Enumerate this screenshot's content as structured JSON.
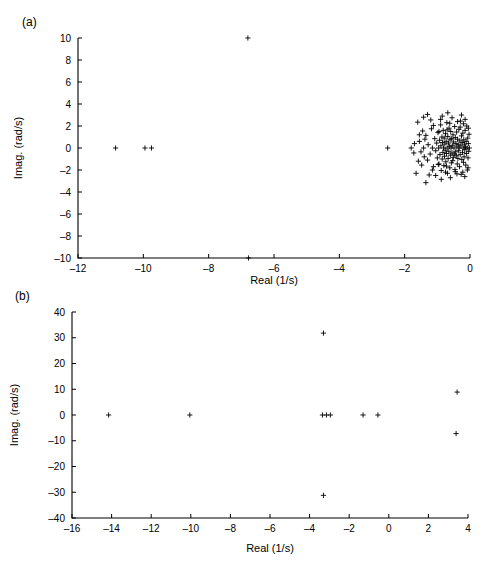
{
  "figure": {
    "panels": [
      {
        "tag": "panel-a",
        "label": "(a)"
      },
      {
        "tag": "panel-b",
        "label": "(b)"
      }
    ]
  },
  "chart_data": [
    {
      "type": "scatter",
      "panel": "(a)",
      "title": "",
      "xlabel": "Real (1/s)",
      "ylabel": "Imag. (rad/s)",
      "xlim": [
        -12,
        0
      ],
      "ylim": [
        -10,
        10
      ],
      "xticks": [
        -12,
        -10,
        -8,
        -6,
        -4,
        -2,
        0
      ],
      "xticklabels": [
        "‒12",
        "‒10",
        "‒8",
        "‒6",
        "‒4",
        "‒2",
        "0"
      ],
      "yticks": [
        -10,
        -8,
        -6,
        -4,
        -2,
        0,
        2,
        4,
        6,
        8,
        10
      ],
      "yticklabels": [
        "‒10",
        "‒8",
        "‒6",
        "‒4",
        "‒2",
        "0",
        "2",
        "4",
        "6",
        "8",
        "10"
      ],
      "grid": false,
      "legend": null,
      "marker": "plus",
      "marker_color": "#000000",
      "points": [
        [
          -6.8,
          10.0
        ],
        [
          -10.85,
          0.0
        ],
        [
          -9.95,
          0.0
        ],
        [
          -9.75,
          0.0
        ],
        [
          -6.78,
          -10.0
        ],
        [
          -2.52,
          0.0
        ],
        [
          -1.55,
          0.6
        ],
        [
          -1.5,
          -0.35
        ],
        [
          -1.42,
          0.0
        ],
        [
          -1.35,
          1.15
        ],
        [
          -1.3,
          -1.1
        ],
        [
          -1.28,
          0.3
        ],
        [
          -1.22,
          -0.55
        ],
        [
          -1.18,
          1.75
        ],
        [
          -1.15,
          0.0
        ],
        [
          -1.12,
          -1.7
        ],
        [
          -1.08,
          0.85
        ],
        [
          -1.05,
          -0.25
        ],
        [
          -1.02,
          0.45
        ],
        [
          -1.0,
          -0.9
        ],
        [
          -0.98,
          1.4
        ],
        [
          -0.96,
          0.0
        ],
        [
          -0.95,
          -1.45
        ],
        [
          -0.93,
          0.7
        ],
        [
          -0.92,
          -0.6
        ],
        [
          -0.9,
          2.1
        ],
        [
          -0.89,
          0.2
        ],
        [
          -0.88,
          -2.05
        ],
        [
          -0.86,
          1.0
        ],
        [
          -0.85,
          -1.0
        ],
        [
          -0.84,
          0.5
        ],
        [
          -0.83,
          -0.4
        ],
        [
          -0.82,
          1.6
        ],
        [
          -0.81,
          0.0
        ],
        [
          -0.8,
          -1.6
        ],
        [
          -0.79,
          0.9
        ],
        [
          -0.78,
          -0.75
        ],
        [
          -0.77,
          0.35
        ],
        [
          -0.76,
          -0.2
        ],
        [
          -0.75,
          1.3
        ],
        [
          -0.74,
          -1.25
        ],
        [
          -0.73,
          0.6
        ],
        [
          -0.72,
          -0.5
        ],
        [
          -0.71,
          2.3
        ],
        [
          -0.7,
          0.0
        ],
        [
          -0.69,
          -2.3
        ],
        [
          -0.68,
          1.05
        ],
        [
          -0.67,
          -0.95
        ],
        [
          -0.66,
          0.45
        ],
        [
          -0.65,
          -0.3
        ],
        [
          -0.64,
          1.8
        ],
        [
          -0.63,
          0.15
        ],
        [
          -0.62,
          -1.8
        ],
        [
          -0.61,
          0.75
        ],
        [
          -0.6,
          -0.65
        ],
        [
          -0.59,
          1.5
        ],
        [
          -0.58,
          0.0
        ],
        [
          -0.57,
          -1.35
        ],
        [
          -0.56,
          0.85
        ],
        [
          -0.55,
          -0.45
        ],
        [
          -0.54,
          0.25
        ],
        [
          -0.53,
          -1.15
        ],
        [
          -0.52,
          1.2
        ],
        [
          -0.51,
          -0.85
        ],
        [
          -0.5,
          0.55
        ],
        [
          -0.49,
          0.0
        ],
        [
          -0.48,
          -0.55
        ],
        [
          -0.47,
          1.95
        ],
        [
          -0.46,
          -1.95
        ],
        [
          -0.45,
          0.95
        ],
        [
          -0.44,
          -0.35
        ],
        [
          -0.43,
          0.4
        ],
        [
          -0.42,
          -0.7
        ],
        [
          -0.41,
          1.45
        ],
        [
          -0.4,
          0.1
        ],
        [
          -0.39,
          -1.45
        ],
        [
          -0.38,
          0.8
        ],
        [
          -0.37,
          -0.95
        ],
        [
          -0.36,
          0.3
        ],
        [
          -0.35,
          -0.25
        ],
        [
          -0.34,
          1.7
        ],
        [
          -0.33,
          0.0
        ],
        [
          -0.32,
          -1.7
        ],
        [
          -0.31,
          0.65
        ],
        [
          -0.3,
          -0.6
        ],
        [
          -0.29,
          2.45
        ],
        [
          -0.28,
          0.2
        ],
        [
          -0.27,
          -2.4
        ],
        [
          -0.26,
          1.1
        ],
        [
          -0.25,
          -1.05
        ],
        [
          -0.24,
          0.5
        ],
        [
          -0.23,
          -0.4
        ],
        [
          -0.22,
          1.35
        ],
        [
          -0.21,
          0.0
        ],
        [
          -0.2,
          -1.3
        ],
        [
          -0.19,
          0.75
        ],
        [
          -0.18,
          -0.8
        ],
        [
          -0.17,
          0.35
        ],
        [
          -0.16,
          -0.15
        ],
        [
          -0.15,
          1.6
        ],
        [
          -0.14,
          0.1
        ],
        [
          -0.13,
          -1.55
        ],
        [
          -0.12,
          0.6
        ],
        [
          -0.11,
          -0.5
        ],
        [
          -0.1,
          2.0
        ],
        [
          -0.09,
          0.0
        ],
        [
          -0.08,
          -2.0
        ],
        [
          -0.07,
          0.9
        ],
        [
          -0.06,
          -0.9
        ],
        [
          -0.05,
          0.4
        ],
        [
          -0.04,
          -0.3
        ],
        [
          -0.03,
          1.25
        ],
        [
          -0.02,
          0.0
        ],
        [
          -0.3,
          1.9
        ],
        [
          -0.45,
          -2.15
        ],
        [
          -0.62,
          2.25
        ],
        [
          -0.75,
          -2.2
        ],
        [
          -0.9,
          2.6
        ],
        [
          -1.05,
          -2.5
        ],
        [
          -1.2,
          2.55
        ],
        [
          -1.25,
          -2.45
        ],
        [
          -1.6,
          2.35
        ],
        [
          -1.65,
          -2.3
        ],
        [
          -1.3,
          3.05
        ],
        [
          -1.35,
          -3.15
        ],
        [
          -1.45,
          1.55
        ],
        [
          -1.48,
          -1.55
        ],
        [
          -1.7,
          0.4
        ],
        [
          -1.72,
          -0.45
        ],
        [
          -1.8,
          0.0
        ],
        [
          -0.55,
          2.75
        ],
        [
          -0.6,
          -2.7
        ],
        [
          -0.2,
          2.2
        ],
        [
          -0.22,
          -2.2
        ],
        [
          -0.38,
          2.4
        ],
        [
          -0.4,
          -2.35
        ],
        [
          -0.85,
          2.9
        ],
        [
          -0.88,
          -2.85
        ],
        [
          -1.12,
          2.05
        ],
        [
          -1.15,
          -2.0
        ],
        [
          -0.05,
          1.8
        ],
        [
          -0.06,
          -1.8
        ],
        [
          -0.15,
          2.6
        ],
        [
          -0.16,
          -2.6
        ],
        [
          -0.68,
          3.2
        ],
        [
          -0.7,
          1.65
        ],
        [
          -0.72,
          -1.65
        ],
        [
          -0.95,
          1.5
        ],
        [
          -0.97,
          -1.5
        ],
        [
          -1.38,
          0.8
        ],
        [
          -1.4,
          -0.8
        ],
        [
          -1.55,
          1.2
        ],
        [
          -1.58,
          -1.2
        ],
        [
          -0.26,
          3.0
        ],
        [
          -1.42,
          2.8
        ]
      ],
      "notes": "Dense cluster of poles near the imaginary axis between Real -1.8 and 0; isolated poles far left and two real-axis outliers at ±10 rad/s."
    },
    {
      "type": "scatter",
      "panel": "(b)",
      "title": "",
      "xlabel": "Real (1/s)",
      "ylabel": "Imag. (rad/s)",
      "xlim": [
        -16,
        4
      ],
      "ylim": [
        -40,
        40
      ],
      "xticks": [
        -16,
        -14,
        -12,
        -10,
        -8,
        -6,
        -4,
        -2,
        0,
        2,
        4
      ],
      "xticklabels": [
        "‒16",
        "‒14",
        "‒12",
        "‒10",
        "‒8",
        "‒6",
        "‒4",
        "‒2",
        "0",
        "2",
        "4"
      ],
      "yticks": [
        -40,
        -30,
        -20,
        -10,
        0,
        10,
        20,
        30,
        40
      ],
      "yticklabels": [
        "‒40",
        "‒30",
        "‒20",
        "‒10",
        "0",
        "10",
        "20",
        "30",
        "40"
      ],
      "grid": false,
      "legend": null,
      "marker": "plus",
      "marker_color": "#000000",
      "points": [
        [
          -3.3,
          31.8
        ],
        [
          -3.3,
          -31.2
        ],
        [
          3.45,
          8.9
        ],
        [
          3.4,
          -7.2
        ],
        [
          -14.15,
          0.0
        ],
        [
          -10.05,
          0.0
        ],
        [
          -3.35,
          0.0
        ],
        [
          -3.15,
          0.0
        ],
        [
          -2.95,
          0.0
        ],
        [
          -1.3,
          0.0
        ],
        [
          -0.55,
          0.0
        ]
      ],
      "notes": "Sparse pole set: a complex conjugate pair near Real −3.3 with Imag ±32, a right-half-plane pair near Real 3.4, and several real poles."
    }
  ]
}
